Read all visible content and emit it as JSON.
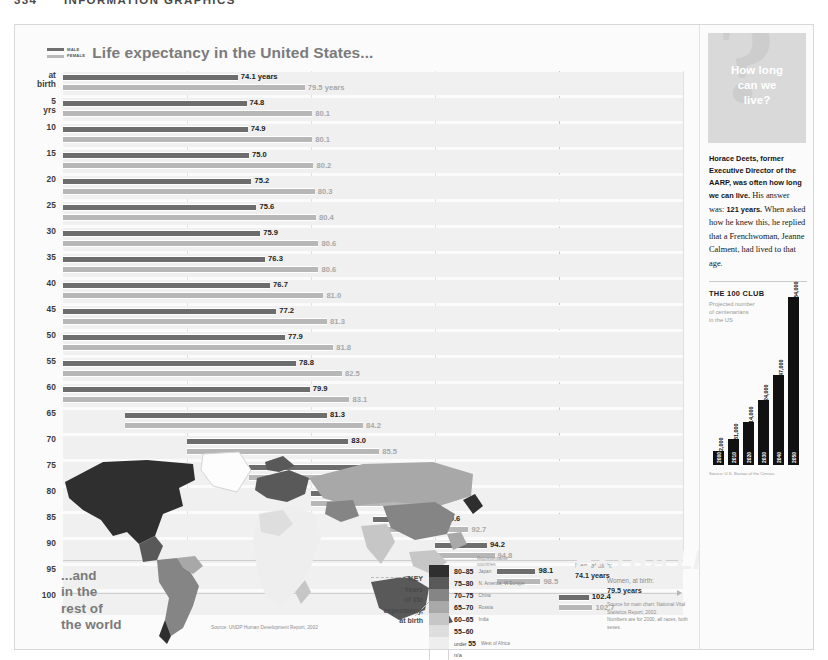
{
  "page": {
    "folio": "334",
    "running_head": "INFORMATION GRAPHICS"
  },
  "chart": {
    "title": "Life expectancy in the United States...",
    "legend": {
      "male": "MALE",
      "female": "FEMALE"
    },
    "men_annotation_label": "Men, at birth:",
    "men_annotation_value": "74.1 years",
    "women_annotation_label": "Women, at birth:",
    "women_annotation_value": "79.5 years",
    "watermark": "EXTRA LIFE!",
    "source": "Source for main chart: National Vital Statistics Report, 2002.",
    "source_note": "Numbers are for 2000, all races, both sexes."
  },
  "chart_data": {
    "type": "bar",
    "title": "Life expectancy in the United States...",
    "xlabel": "Total life expectancy (years)",
    "ylabel": "Current age",
    "xlim": [
      60,
      110
    ],
    "grid": true,
    "legend_position": "top-left",
    "orientation": "horizontal",
    "categories": [
      "at birth",
      "5 yrs",
      "10",
      "15",
      "20",
      "25",
      "30",
      "35",
      "40",
      "45",
      "50",
      "55",
      "60",
      "65",
      "70",
      "75",
      "80",
      "85",
      "90",
      "95",
      "100"
    ],
    "series": [
      {
        "name": "MALE",
        "values": [
          74.1,
          74.8,
          74.9,
          75.0,
          75.2,
          75.6,
          75.9,
          76.3,
          76.7,
          77.2,
          77.9,
          78.8,
          79.9,
          81.3,
          83.0,
          85.2,
          87.6,
          90.6,
          94.2,
          98.1,
          102.4
        ]
      },
      {
        "name": "FEMALE",
        "values": [
          79.5,
          80.1,
          80.1,
          80.2,
          80.3,
          80.4,
          80.6,
          80.6,
          81.0,
          81.3,
          81.8,
          82.5,
          83.1,
          84.2,
          85.5,
          87.1,
          89.1,
          92.7,
          94.8,
          98.5,
          102.7
        ]
      }
    ],
    "value_labels": {
      "male": [
        "74.1 years",
        "74.8",
        "74.9",
        "75.0",
        "75.2",
        "75.6",
        "75.9",
        "76.3",
        "76.7",
        "77.2",
        "77.9",
        "78.8",
        "79.9",
        "81.3",
        "83.0",
        "85.2",
        "87.6",
        "90.6",
        "94.2",
        "98.1",
        "102.4"
      ],
      "female": [
        "79.5 years",
        "80.1",
        "80.1",
        "80.2",
        "80.3",
        "80.4",
        "80.6",
        "80.6",
        "81.0",
        "81.3",
        "81.8",
        "82.5",
        "83.1",
        "84.2",
        "85.5",
        "87.1",
        "89.1",
        "92.7",
        "94.8",
        "98.5",
        "102.7"
      ]
    }
  },
  "map": {
    "heading_line1": "...and",
    "heading_line2": "in the",
    "heading_line3": "rest of",
    "heading_line4": "the world",
    "source": "Source: UNDP Human Development Report, 2002"
  },
  "key": {
    "title_line1": "KEY",
    "title_line2": "Years",
    "title_line3": "of life",
    "title_line4": "expectancy,",
    "title_line5": "at birth",
    "rep_line1": "Representative",
    "rep_line2": "countries",
    "entries": [
      {
        "range": "80–85",
        "prefix": "",
        "country": "Japan",
        "color": "#2f2f2f"
      },
      {
        "range": "75–80",
        "prefix": "",
        "country": "N. America, W.Europe",
        "color": "#595959"
      },
      {
        "range": "70–75",
        "prefix": "",
        "country": "China",
        "color": "#858585"
      },
      {
        "range": "65–70",
        "prefix": "",
        "country": "Russia",
        "color": "#a8a8a8"
      },
      {
        "range": "60–65",
        "prefix": "",
        "country": "India",
        "color": "#c6c6c6"
      },
      {
        "range": "55–60",
        "prefix": "",
        "country": "",
        "color": "#dedede"
      },
      {
        "range": "55",
        "prefix": "under",
        "country": "West of Africa",
        "color": "#eeeeee"
      },
      {
        "range": "n/a",
        "prefix": "",
        "country": "",
        "color": "#ffffff"
      }
    ]
  },
  "sidebar": {
    "headline_line1": "How long",
    "headline_line2": "can we",
    "headline_line3": "live?",
    "question_glyph": "?",
    "body_bold": "Horace Deets, former Executive Director of the AARP, was often how long we can live.",
    "body_answer_lead": "His answer was:",
    "body_answer": "121 years.",
    "body_rest": "When asked how he knew this, he replied that a Frenchwoman, Jeanne Calment, had lived to that age.",
    "club": {
      "title": "THE 100 CLUB",
      "subtitle_line1": "Projected number",
      "subtitle_line2": "of centenarians",
      "subtitle_line3": "in the US",
      "source": "Source: U.S. Bureau of the Census"
    }
  },
  "club_chart_data": {
    "type": "bar",
    "title": "THE 100 CLUB",
    "subtitle": "Projected number of centenarians in the US",
    "xlabel": "Year",
    "ylabel": "Centenarians",
    "categories": [
      "2000",
      "2010",
      "2020",
      "2030",
      "2040",
      "2050"
    ],
    "values": [
      72000,
      131000,
      214000,
      324000,
      447000,
      834000
    ],
    "value_labels": [
      "72,000",
      "131,000",
      "214,000",
      "324,000",
      "447,000",
      "834,000"
    ],
    "ylim": [
      0,
      834000
    ],
    "grid": false
  },
  "colors": {
    "male_bar": "#6d6d6d",
    "female_bar": "#b7b7b7",
    "row_band": "#f0f0f0",
    "sidebar_panel": "#d9d9d9",
    "club_bar": "#111111"
  }
}
